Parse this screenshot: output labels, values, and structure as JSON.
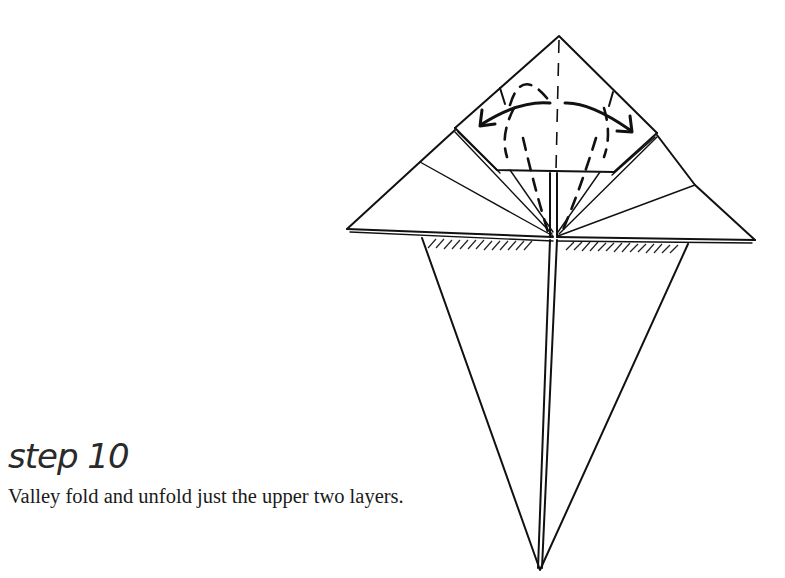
{
  "step": {
    "title": "step 10",
    "instruction": "Valley fold and unfold just the upper two layers."
  },
  "diagram": {
    "colors": {
      "ink": "#111111",
      "paper": "#ffffff"
    },
    "symbols": [
      "valley-fold-dashed-line",
      "fold-and-unfold-arrow",
      "hatched-shading"
    ]
  }
}
